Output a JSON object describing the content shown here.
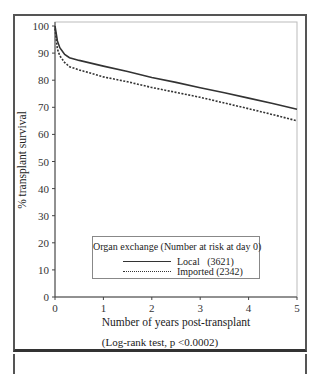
{
  "chart_data": {
    "type": "line",
    "title": "",
    "xlabel": "Number of years post-transplant",
    "ylabel": "% transplant survival",
    "xlim": [
      0,
      5
    ],
    "ylim": [
      0,
      100
    ],
    "x_ticks": [
      0,
      1,
      2,
      3,
      4,
      5
    ],
    "y_ticks": [
      0,
      10,
      20,
      30,
      40,
      50,
      60,
      70,
      80,
      90,
      100
    ],
    "grid": false,
    "legend_position": "lower center (inside plot)",
    "legend_title": "Organ exchange (Number at risk at day 0)",
    "annotation": "(Log-rank test, p <0.0002)",
    "series": [
      {
        "name": "Local",
        "n_at_risk": 3621,
        "style": "solid",
        "x": [
          0,
          0.05,
          0.1,
          0.2,
          0.3,
          0.5,
          1.0,
          1.5,
          2.0,
          2.5,
          3.0,
          3.5,
          4.0,
          4.5,
          5.0
        ],
        "y": [
          100,
          94.5,
          92,
          89.5,
          88.3,
          87.3,
          85.2,
          83.2,
          81,
          79.2,
          77.2,
          75.4,
          73.4,
          71.4,
          69.3
        ]
      },
      {
        "name": "Imported",
        "n_at_risk": 2342,
        "style": "dashed",
        "x": [
          0,
          0.05,
          0.1,
          0.2,
          0.3,
          0.5,
          1.0,
          1.5,
          2.0,
          2.5,
          3.0,
          3.5,
          4.0,
          4.5,
          5.0
        ],
        "y": [
          99,
          91.5,
          89,
          86.5,
          85,
          83.8,
          81.2,
          79.4,
          77.3,
          75.5,
          73.7,
          71.6,
          69.5,
          67.3,
          65
        ]
      }
    ]
  },
  "axes": {
    "y_title": "% transplant survival",
    "x_title": "Number of years post-transplant",
    "y_tick_labels": [
      "0",
      "10",
      "20",
      "30",
      "40",
      "50",
      "60",
      "70",
      "80",
      "90",
      "100"
    ],
    "x_tick_labels": [
      "0",
      "1",
      "2",
      "3",
      "4",
      "5"
    ]
  },
  "legend": {
    "title": "Organ exchange (Number at risk at day 0)",
    "items": [
      {
        "label": "Local   (3621)"
      },
      {
        "label": "Imported (2342)"
      }
    ]
  },
  "footnote": "(Log-rank test, p <0.0002)"
}
